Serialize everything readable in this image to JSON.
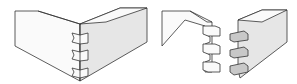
{
  "diagram": {
    "figures": [
      {
        "id": "assembled",
        "label": ""
      },
      {
        "id": "exploded",
        "label": ""
      }
    ],
    "colors": {
      "stroke": "#333333",
      "light_face": "#fafafa",
      "shaded_face": "#e6e6e6",
      "dark_face": "#c8c8c8"
    }
  }
}
